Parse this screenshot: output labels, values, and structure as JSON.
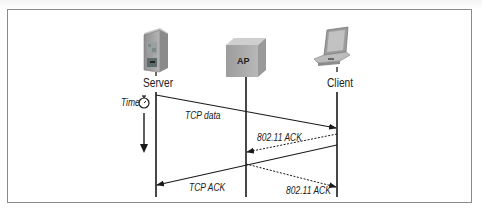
{
  "diagram": {
    "type": "sequence",
    "nodes": [
      {
        "id": "server",
        "label": "Server",
        "icon": "server-tower-icon"
      },
      {
        "id": "ap",
        "label": "AP",
        "icon": "access-point-box-icon"
      },
      {
        "id": "client",
        "label": "Client",
        "icon": "laptop-icon"
      }
    ],
    "time": {
      "label": "Time",
      "icon": "stopwatch-icon",
      "direction": "down"
    },
    "messages": [
      {
        "from": "server",
        "to": "client",
        "label": "TCP data",
        "style": "solid"
      },
      {
        "from": "client",
        "to": "ap",
        "label": "802.11 ACK",
        "style": "dashed"
      },
      {
        "from": "client",
        "to": "server",
        "label": "TCP ACK",
        "style": "solid"
      },
      {
        "from": "ap",
        "to": "client",
        "label": "802.11 ACK",
        "style": "dashed"
      }
    ]
  },
  "colors": {
    "line": "#1a1a1a",
    "frame": "#8a8a8a",
    "device_gray": "#a9a9a9"
  }
}
